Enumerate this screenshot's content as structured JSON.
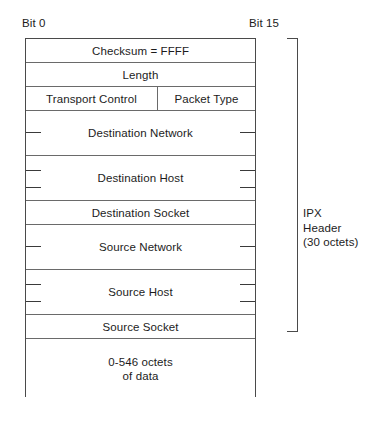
{
  "figure": {
    "bit_labels": {
      "left": "Bit 0",
      "right": "Bit 15"
    },
    "bracket": {
      "label": "IPX\nHeader\n(30 octets)"
    },
    "rows": [
      {
        "name": "checksum",
        "label": "Checksum  =  FFFF",
        "ticks": 0
      },
      {
        "name": "length",
        "label": "Length",
        "ticks": 0
      },
      {
        "name": "transport-control",
        "label": "Transport Control",
        "ticks": 0
      },
      {
        "name": "packet-type",
        "label": "Packet Type",
        "ticks": 0
      },
      {
        "name": "destination-network",
        "label": "Destination Network",
        "ticks": 1
      },
      {
        "name": "destination-host",
        "label": "Destination Host",
        "ticks": 2
      },
      {
        "name": "destination-socket",
        "label": "Destination Socket",
        "ticks": 0
      },
      {
        "name": "source-network",
        "label": "Source Network",
        "ticks": 1
      },
      {
        "name": "source-host",
        "label": "Source Host",
        "ticks": 2
      },
      {
        "name": "source-socket",
        "label": "Source Socket",
        "ticks": 0
      },
      {
        "name": "data",
        "label": "0-546 octets\nof data",
        "ticks": 0
      }
    ]
  }
}
